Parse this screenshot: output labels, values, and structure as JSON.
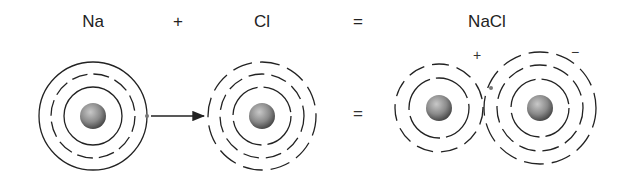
{
  "title_row": {
    "reactant1": "Na",
    "plus": "+",
    "reactant2": "Cl",
    "equals": "=",
    "product": "NaCl"
  },
  "diagram_row": {
    "equals": "=",
    "cation_charge": "+",
    "anion_charge": "−"
  },
  "atoms": [
    {
      "name": "Na",
      "shells": [
        "solid",
        "dashed",
        "solid"
      ]
    },
    {
      "name": "Cl",
      "shells": [
        "dashed",
        "dashed",
        "dashed"
      ]
    },
    {
      "name": "Na+",
      "shells": [
        "dashed",
        "dashed"
      ]
    },
    {
      "name": "Cl-",
      "shells": [
        "dashed",
        "dashed",
        "dashed"
      ]
    }
  ],
  "colors": {
    "line": "#222222",
    "nucleus_light": "#bdbdbd",
    "nucleus_dark": "#4a4a4a"
  }
}
